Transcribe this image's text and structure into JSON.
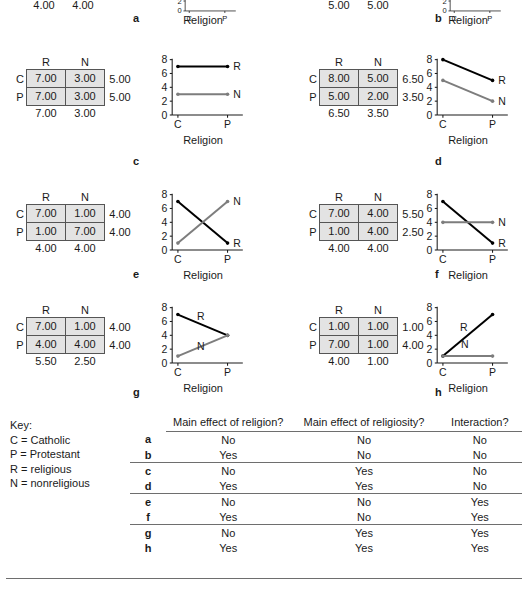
{
  "figure": {
    "axis_labels": {
      "x": "Religion",
      "y_line1": "Mean Ideal",
      "y_line2": "Family Size",
      "row_factor": "Religion"
    },
    "x_ticks": [
      "C",
      "P"
    ],
    "y_ticks": [
      "0",
      "2",
      "4",
      "6",
      "8"
    ],
    "col_headers": [
      "R",
      "N"
    ],
    "row_headers": [
      "C",
      "P"
    ],
    "series_labels": {
      "r": "R",
      "n": "N"
    },
    "colors": {
      "religious_line": "#000000",
      "nonreligious_line": "#7d7d7d",
      "cell_fill": "#e3e3e3",
      "rule": "#6e6e6e"
    }
  },
  "panels": [
    {
      "letter": "a",
      "clipped": true,
      "show_side_label": false,
      "cells": [
        [
          "4.00",
          "4.00"
        ],
        [
          "4.00",
          "4.00"
        ]
      ],
      "row_margins": [
        "4.00",
        "4.00"
      ],
      "col_margins": [
        "4.00",
        "4.00"
      ],
      "chart_data": {
        "type": "line",
        "categories": [
          "C",
          "P"
        ],
        "series": [
          {
            "name": "R",
            "values": [
              4,
              4
            ]
          },
          {
            "name": "N",
            "values": [
              4,
              4
            ]
          }
        ],
        "xlabel": "Religion",
        "ylabel": "Mean Ideal Family Size",
        "ylim": [
          0,
          8
        ],
        "yticks": [
          0,
          2,
          4,
          6,
          8
        ]
      }
    },
    {
      "letter": "b",
      "clipped": true,
      "show_side_label": false,
      "cells": [
        [
          "5.00",
          "5.00"
        ],
        [
          "5.00",
          "5.00"
        ]
      ],
      "row_margins": [
        "5.00",
        "5.00"
      ],
      "col_margins": [
        "5.00",
        "5.00"
      ],
      "chart_data": {
        "type": "line",
        "categories": [
          "C",
          "P"
        ],
        "series": [
          {
            "name": "R",
            "values": [
              7,
              3
            ]
          },
          {
            "name": "N",
            "values": [
              7,
              3
            ]
          }
        ],
        "xlabel": "Religion",
        "ylabel": "Mean Ideal Family Size",
        "ylim": [
          0,
          8
        ],
        "yticks": [
          0,
          2,
          4,
          6,
          8
        ]
      }
    },
    {
      "letter": "c",
      "clipped": false,
      "show_side_label": true,
      "cells": [
        [
          "7.00",
          "3.00"
        ],
        [
          "7.00",
          "3.00"
        ]
      ],
      "row_margins": [
        "5.00",
        "5.00"
      ],
      "col_margins": [
        "7.00",
        "3.00"
      ],
      "chart_data": {
        "type": "line",
        "categories": [
          "C",
          "P"
        ],
        "series": [
          {
            "name": "R",
            "values": [
              7,
              7
            ]
          },
          {
            "name": "N",
            "values": [
              3,
              3
            ]
          }
        ],
        "xlabel": "Religion",
        "ylabel": "Mean Ideal Family Size",
        "ylim": [
          0,
          8
        ],
        "yticks": [
          0,
          2,
          4,
          6,
          8
        ]
      }
    },
    {
      "letter": "d",
      "clipped": false,
      "show_side_label": false,
      "cells": [
        [
          "8.00",
          "5.00"
        ],
        [
          "5.00",
          "2.00"
        ]
      ],
      "row_margins": [
        "6.50",
        "3.50"
      ],
      "col_margins": [
        "6.50",
        "3.50"
      ],
      "chart_data": {
        "type": "line",
        "categories": [
          "C",
          "P"
        ],
        "series": [
          {
            "name": "R",
            "values": [
              8,
              5
            ]
          },
          {
            "name": "N",
            "values": [
              5,
              2
            ]
          }
        ],
        "xlabel": "Religion",
        "ylabel": "Mean Ideal Family Size",
        "ylim": [
          0,
          8
        ],
        "yticks": [
          0,
          2,
          4,
          6,
          8
        ]
      }
    },
    {
      "letter": "e",
      "clipped": false,
      "show_side_label": true,
      "cells": [
        [
          "7.00",
          "1.00"
        ],
        [
          "1.00",
          "7.00"
        ]
      ],
      "row_margins": [
        "4.00",
        "4.00"
      ],
      "col_margins": [
        "4.00",
        "4.00"
      ],
      "chart_data": {
        "type": "line",
        "categories": [
          "C",
          "P"
        ],
        "series": [
          {
            "name": "R",
            "values": [
              7,
              1
            ]
          },
          {
            "name": "N",
            "values": [
              1,
              7
            ]
          }
        ],
        "xlabel": "Religion",
        "ylabel": "Mean Ideal Family Size",
        "ylim": [
          0,
          8
        ],
        "yticks": [
          0,
          2,
          4,
          6,
          8
        ]
      }
    },
    {
      "letter": "f",
      "clipped": false,
      "show_side_label": false,
      "cells": [
        [
          "7.00",
          "4.00"
        ],
        [
          "1.00",
          "4.00"
        ]
      ],
      "row_margins": [
        "5.50",
        "2.50"
      ],
      "col_margins": [
        "4.00",
        "4.00"
      ],
      "chart_data": {
        "type": "line",
        "categories": [
          "C",
          "P"
        ],
        "series": [
          {
            "name": "R",
            "values": [
              7,
              1
            ]
          },
          {
            "name": "N",
            "values": [
              4,
              4
            ]
          }
        ],
        "xlabel": "Religion",
        "ylabel": "Mean Ideal Family Size",
        "ylim": [
          0,
          8
        ],
        "yticks": [
          0,
          2,
          4,
          6,
          8
        ]
      }
    },
    {
      "letter": "g",
      "clipped": false,
      "show_side_label": true,
      "cells": [
        [
          "7.00",
          "1.00"
        ],
        [
          "4.00",
          "4.00"
        ]
      ],
      "row_margins": [
        "4.00",
        "4.00"
      ],
      "col_margins": [
        "5.50",
        "2.50"
      ],
      "chart_data": {
        "type": "line",
        "categories": [
          "C",
          "P"
        ],
        "series": [
          {
            "name": "R",
            "values": [
              7,
              4
            ]
          },
          {
            "name": "N",
            "values": [
              1,
              4
            ]
          }
        ],
        "xlabel": "Religion",
        "ylabel": "Mean Ideal Family Size",
        "ylim": [
          0,
          8
        ],
        "yticks": [
          0,
          2,
          4,
          6,
          8
        ]
      }
    },
    {
      "letter": "h",
      "clipped": false,
      "show_side_label": false,
      "cells": [
        [
          "1.00",
          "1.00"
        ],
        [
          "7.00",
          "1.00"
        ]
      ],
      "row_margins": [
        "1.00",
        "4.00"
      ],
      "col_margins": [
        "4.00",
        "1.00"
      ],
      "chart_data": {
        "type": "line",
        "categories": [
          "C",
          "P"
        ],
        "series": [
          {
            "name": "R",
            "values": [
              1,
              7
            ]
          },
          {
            "name": "N",
            "values": [
              1,
              1
            ]
          }
        ],
        "xlabel": "Religion",
        "ylabel": "Mean Ideal Family Size",
        "ylim": [
          0,
          8
        ],
        "yticks": [
          0,
          2,
          4,
          6,
          8
        ]
      }
    }
  ],
  "key": {
    "title": "Key:",
    "entries": [
      "C = Catholic",
      "P = Protestant",
      "R = religious",
      "N = nonreligious"
    ]
  },
  "summary": {
    "headers": [
      "",
      "Main effect of religion?",
      "Main effect of religiosity?",
      "Interaction?"
    ],
    "rows": [
      {
        "letter": "a",
        "religion": "No",
        "religiosity": "No",
        "interaction": "No"
      },
      {
        "letter": "b",
        "religion": "Yes",
        "religiosity": "No",
        "interaction": "No"
      },
      {
        "letter": "c",
        "religion": "No",
        "religiosity": "Yes",
        "interaction": "No"
      },
      {
        "letter": "d",
        "religion": "Yes",
        "religiosity": "Yes",
        "interaction": "No"
      },
      {
        "letter": "e",
        "religion": "No",
        "religiosity": "No",
        "interaction": "Yes"
      },
      {
        "letter": "f",
        "religion": "Yes",
        "religiosity": "No",
        "interaction": "Yes"
      },
      {
        "letter": "g",
        "religion": "No",
        "religiosity": "Yes",
        "interaction": "Yes"
      },
      {
        "letter": "h",
        "religion": "Yes",
        "religiosity": "Yes",
        "interaction": "Yes"
      }
    ]
  }
}
